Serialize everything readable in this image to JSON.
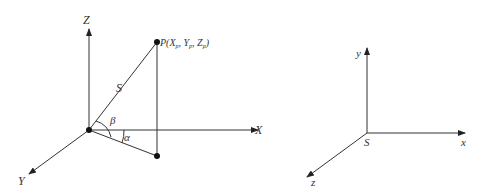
{
  "left_diagram": {
    "axes": {
      "x_label": "X",
      "y_label": "Y",
      "z_label": "Z"
    },
    "point_label": "P(X",
    "point_sub_x": "p",
    "point_mid_y": ", Y",
    "point_sub_y": "p",
    "point_mid_z": ", Z",
    "point_sub_z": "p",
    "point_close": ")",
    "distance_label": "S",
    "angle_alpha": "α",
    "angle_beta": "β"
  },
  "right_diagram": {
    "axes": {
      "x_label": "x",
      "y_label": "y",
      "z_label": "z"
    },
    "origin_label": "S"
  }
}
